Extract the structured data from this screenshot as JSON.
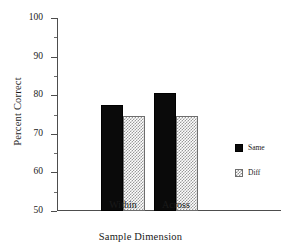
{
  "chart_data": {
    "type": "bar",
    "title": "",
    "subtitle": "",
    "xlabel": "Sample Dimension",
    "ylabel": "Percent Correct",
    "categories": [
      "Within",
      "Across"
    ],
    "series": [
      {
        "name": "Same",
        "values": [
          77.5,
          80.5
        ],
        "color": "#0a0a0a",
        "pattern": "solid"
      },
      {
        "name": "Diff",
        "values": [
          74.6,
          74.7
        ],
        "color": "#9a9a9a",
        "pattern": "checkerboard"
      }
    ],
    "ylim": [
      50,
      100
    ],
    "y_major_ticks": [
      50,
      60,
      70,
      80,
      90,
      100
    ],
    "y_tick_labels": [
      "50",
      "60",
      "70",
      "80",
      "90",
      "100"
    ],
    "y_minor_ticks": [
      55,
      65,
      75,
      85,
      95
    ],
    "grid": false,
    "legend_position": "right"
  },
  "legend": {
    "entries": [
      {
        "label": "Same"
      },
      {
        "label": "Diff"
      }
    ]
  },
  "axes": {
    "y_title": "Percent Correct",
    "x_title": "Sample Dimension"
  }
}
